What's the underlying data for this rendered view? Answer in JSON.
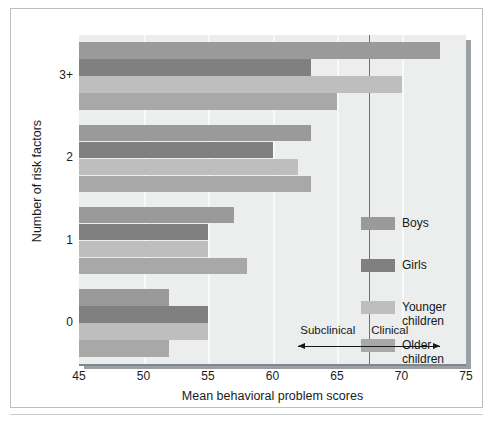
{
  "chart_data": {
    "type": "bar",
    "orientation": "horizontal",
    "title": "",
    "xlabel": "Mean behavioral problem scores",
    "ylabel": "Number of risk factors",
    "categories": [
      "0",
      "1",
      "2",
      "3+"
    ],
    "xlim": [
      45,
      75
    ],
    "xticks": [
      45,
      50,
      55,
      60,
      65,
      70,
      75
    ],
    "grid": true,
    "grid_axis": "x",
    "legend_position": "right-inside",
    "series": [
      {
        "name": "Boys",
        "color": "#9a9a9a",
        "values": [
          52,
          57,
          63,
          73
        ]
      },
      {
        "name": "Girls",
        "color": "#808080",
        "values": [
          55,
          55,
          60,
          63
        ]
      },
      {
        "name": "Younger\nchildren",
        "color": "#bebebe",
        "values": [
          55,
          55,
          62,
          70
        ]
      },
      {
        "name": "Older\nchildren",
        "color": "#a8a8a8",
        "values": [
          52,
          58,
          63,
          65
        ]
      }
    ],
    "annotations": [
      {
        "label": "Subclinical",
        "arrow": "left",
        "range": [
          62.0,
          67.5
        ]
      },
      {
        "label": "Clinical",
        "arrow": "right",
        "range": [
          67.5,
          73.0
        ]
      }
    ],
    "divider_x": 67.5,
    "plot_background": "#eceeee",
    "gridline_color": "#f8f9f9"
  },
  "axis": {
    "x_tick_labels": [
      "45",
      "50",
      "55",
      "60",
      "65",
      "70",
      "75"
    ],
    "y_tick_labels": [
      "3+",
      "2",
      "1",
      "0"
    ],
    "x_title": "Mean behavioral problem scores",
    "y_title": "Number of risk factors"
  },
  "legend": {
    "items": [
      {
        "label": "Boys"
      },
      {
        "label": "Girls"
      },
      {
        "label": "Younger\nchildren"
      },
      {
        "label": "Older\nchildren"
      }
    ]
  },
  "annotations": {
    "subclinical": "Subclinical",
    "clinical": "Clinical"
  }
}
